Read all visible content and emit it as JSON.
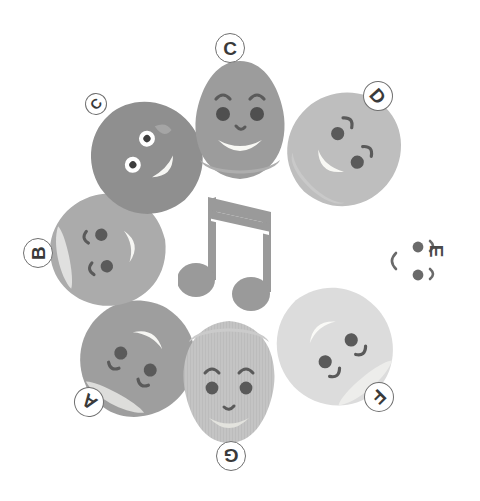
{
  "canvas": {
    "width": 480,
    "height": 501,
    "background": "#ffffff"
  },
  "illustration": {
    "title": "Seven cartoon blob faces arranged in a ring around a music note",
    "center_icon": {
      "name": "beamed-eighth-notes",
      "glyph": "♫",
      "color": "#9a9a9a"
    },
    "palette": {
      "darkest": "#8c8c8c",
      "dark": "#9e9e9e",
      "medium": "#a8a8a8",
      "light": "#bdbdbd",
      "lighter": "#cfcfcf",
      "lightest": "#dedede",
      "white": "#ffffff",
      "face_mark": "#5a5a5a",
      "badge_text": "#3a3a3a",
      "badge_border": "#6f6f6f",
      "mouth_fill": "#f3f3f1"
    },
    "characters": [
      {
        "id": "char-a",
        "label": "A",
        "label_rotation": -145,
        "body_color": "#9e9e9e",
        "body_rotation": -150,
        "x": 74,
        "y": 296,
        "size": 126,
        "eye_style": "plain",
        "badge": {
          "x": 74,
          "y": 387,
          "size": "normal"
        }
      },
      {
        "id": "char-b",
        "label": "B",
        "label_rotation": -90,
        "body_color": "#ababab",
        "body_rotation": -100,
        "x": 47,
        "y": 190,
        "size": 120,
        "eye_style": "plain",
        "badge": {
          "x": 23,
          "y": 238,
          "size": "normal"
        }
      },
      {
        "id": "char-c2",
        "label": "C",
        "label_rotation": -48,
        "body_color": "#8f8f8f",
        "body_rotation": -42,
        "x": 87,
        "y": 98,
        "size": 118,
        "eye_style": "googly",
        "badge": {
          "x": 85,
          "y": 93,
          "size": "small"
        }
      },
      {
        "id": "char-c",
        "label": "C",
        "label_rotation": 0,
        "body_color": "#9c9c9c",
        "body_rotation": 0,
        "x": 178,
        "y": 58,
        "size": 124,
        "eye_style": "plain",
        "badge": {
          "x": 215,
          "y": 33,
          "size": "normal"
        }
      },
      {
        "id": "char-d",
        "label": "D",
        "label_rotation": 48,
        "body_color": "#bebebe",
        "body_rotation": 44,
        "x": 284,
        "y": 88,
        "size": 122,
        "eye_style": "plain",
        "badge": {
          "x": 363,
          "y": 81,
          "size": "normal"
        }
      },
      {
        "id": "char-e",
        "label": "E",
        "label_rotation": 90,
        "body_color": "#ffffff",
        "body_rotation": 90,
        "x": 358,
        "y": 205,
        "size": 112,
        "eye_style": "plain",
        "badge": {
          "x": 425,
          "y": 240,
          "size": "none"
        }
      },
      {
        "id": "char-f",
        "label": "F",
        "label_rotation": 135,
        "body_color": "#dcdcdc",
        "body_rotation": 140,
        "x": 272,
        "y": 284,
        "size": 126,
        "eye_style": "plain",
        "badge": {
          "x": 364,
          "y": 382,
          "size": "normal"
        }
      },
      {
        "id": "char-g",
        "label": "G",
        "label_rotation": 180,
        "body_color": "#c4c4c4",
        "body_rotation": 180,
        "x": 165,
        "y": 318,
        "size": 128,
        "eye_style": "plain",
        "badge": {
          "x": 216,
          "y": 441,
          "size": "normal"
        }
      }
    ]
  }
}
